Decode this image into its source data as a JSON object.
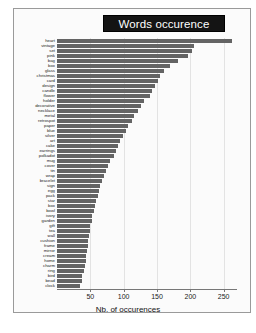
{
  "chart": {
    "title": "Words occurence",
    "xlabel": "Nb. of occurences",
    "bar_color": "#646464",
    "title_bg": "#141414",
    "title_fg": "#ffffff"
  },
  "chart_data": {
    "type": "bar",
    "orientation": "horizontal",
    "title": "Words occurence",
    "xlabel": "Nb. of occurences",
    "ylabel": "",
    "xlim": [
      0,
      270
    ],
    "xticks": [
      50,
      100,
      150,
      200,
      250
    ],
    "grid": true,
    "legend": null,
    "categories": [
      "heart",
      "vintage",
      "set",
      "pink",
      "bag",
      "box",
      "glass",
      "christmas",
      "card",
      "design",
      "candle",
      "flower",
      "holder",
      "decorative",
      "necklace",
      "metal",
      "retrospot",
      "paper",
      "blue",
      "silver",
      "art",
      "cake",
      "earrings",
      "polkadot",
      "mug",
      "cover",
      "tin",
      "wrap",
      "bracelet",
      "sign",
      "egg",
      "pack",
      "star",
      "box",
      "bowl",
      "ivory",
      "garden",
      "gift",
      "tea",
      "wall",
      "cushion",
      "frame",
      "mirror",
      "cream",
      "home",
      "charm",
      "ring",
      "bird",
      "bead",
      "clock"
    ],
    "values": [
      263,
      205,
      203,
      196,
      181,
      169,
      161,
      155,
      151,
      147,
      143,
      139,
      131,
      126,
      121,
      116,
      112,
      107,
      103,
      99,
      95,
      91,
      88,
      85,
      80,
      77,
      74,
      71,
      68,
      65,
      63,
      61,
      59,
      57,
      55,
      53,
      52,
      50,
      49,
      48,
      47,
      46,
      45,
      44,
      43,
      42,
      40,
      38,
      37,
      35
    ]
  }
}
